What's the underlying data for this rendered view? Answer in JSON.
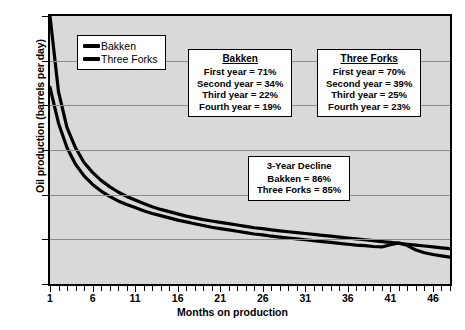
{
  "figure": {
    "xlabel": "Months on production",
    "ylabel": "Oil production (barrels per day)",
    "caption": ""
  },
  "legend": {
    "items": [
      {
        "label": "Bakken",
        "color": "#000000"
      },
      {
        "label": "Three Forks",
        "color": "#000000"
      }
    ]
  },
  "annotations": {
    "bakken": {
      "header": "Bakken",
      "lines": [
        "First year = 71%",
        "Second year = 34%",
        "Third year = 22%",
        "Fourth year = 19%"
      ]
    },
    "three_forks": {
      "header": "Three Forks",
      "lines": [
        "First year = 70%",
        "Second year = 39%",
        "Third year = 25%",
        "Fourth year = 23%"
      ]
    },
    "decline": {
      "header": "3-Year Decline",
      "lines": [
        "Bakken = 86%",
        "Three Forks = 85%"
      ]
    }
  },
  "axes": {
    "y_ticks": [
      "600",
      "500",
      "400",
      "300",
      "200",
      "100",
      "0"
    ],
    "x_ticks": [
      "1",
      "6",
      "11",
      "16",
      "21",
      "26",
      "31",
      "36",
      "41",
      "46"
    ]
  },
  "chart_data": {
    "type": "line",
    "title": "",
    "xlabel": "Months on production",
    "ylabel": "Oil production (barrels per day)",
    "xlim": [
      1,
      48
    ],
    "ylim": [
      0,
      600
    ],
    "ytick_values": [
      0,
      100,
      200,
      300,
      400,
      500,
      600
    ],
    "xtick_values": [
      1,
      6,
      11,
      16,
      21,
      26,
      31,
      36,
      41,
      46
    ],
    "grid": "horizontal",
    "legend_position": "upper-left-inside",
    "x": [
      1,
      2,
      3,
      4,
      5,
      6,
      7,
      8,
      9,
      10,
      11,
      12,
      13,
      14,
      15,
      16,
      17,
      18,
      19,
      20,
      21,
      22,
      23,
      24,
      25,
      26,
      27,
      28,
      29,
      30,
      31,
      32,
      33,
      34,
      35,
      36,
      37,
      38,
      39,
      40,
      41,
      42,
      43,
      44,
      45,
      46,
      47,
      48
    ],
    "series": [
      {
        "name": "Bakken",
        "color": "#000000",
        "values": [
          600,
          430,
          350,
          305,
          272,
          250,
          232,
          218,
          206,
          196,
          188,
          180,
          173,
          167,
          162,
          157,
          152,
          148,
          144,
          141,
          138,
          135,
          132,
          129,
          126,
          124,
          121,
          119,
          117,
          115,
          113,
          111,
          109,
          107,
          105,
          103,
          101,
          99,
          97,
          95,
          93,
          91,
          89,
          87,
          85,
          83,
          81,
          79
        ]
      },
      {
        "name": "Three Forks",
        "color": "#000000",
        "values": [
          440,
          360,
          305,
          268,
          242,
          223,
          208,
          196,
          186,
          178,
          171,
          164,
          158,
          153,
          148,
          143,
          139,
          135,
          131,
          127,
          124,
          121,
          118,
          115,
          112,
          110,
          107,
          105,
          103,
          101,
          99,
          97,
          95,
          93,
          91,
          89,
          87,
          86,
          84,
          83,
          88,
          92,
          86,
          76,
          70,
          66,
          63,
          60
        ]
      }
    ],
    "annotations": {
      "bakken_decline": {
        "first_year": "71%",
        "second_year": "34%",
        "third_year": "22%",
        "fourth_year": "19%"
      },
      "three_forks_decline": {
        "first_year": "70%",
        "second_year": "39%",
        "third_year": "25%",
        "fourth_year": "23%"
      },
      "three_year_decline": {
        "bakken": "86%",
        "three_forks": "85%"
      }
    }
  }
}
